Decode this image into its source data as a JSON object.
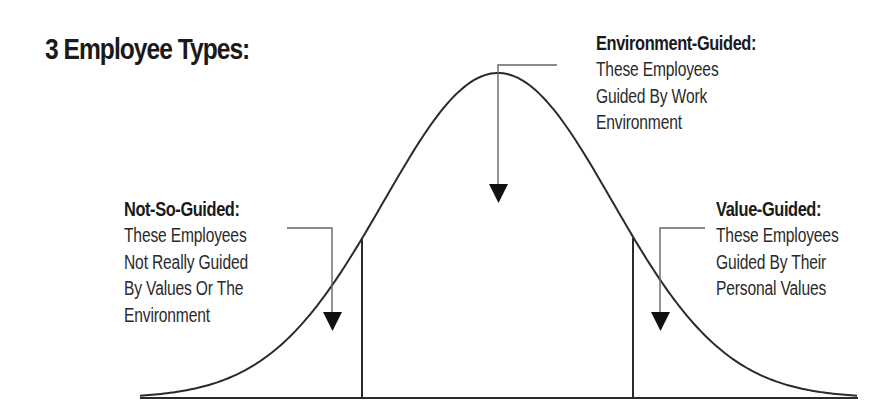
{
  "title": "3 Employee Types:",
  "groups": [
    {
      "id": "not-so-guided",
      "heading": "Not-So-Guided:",
      "lines": [
        "These Employees",
        "Not Really Guided",
        "By Values Or The",
        "Environment"
      ]
    },
    {
      "id": "environment-guided",
      "heading": "Environment-Guided:",
      "lines": [
        "These Employees",
        "Guided By Work",
        "Environment"
      ]
    },
    {
      "id": "value-guided",
      "heading": "Value-Guided:",
      "lines": [
        "These Employees",
        "Guided By Their",
        "Personal Values"
      ]
    }
  ],
  "chart_data": {
    "type": "diagram",
    "shape": "bell-curve (normal distribution)",
    "title": "3 Employee Types:",
    "regions": [
      {
        "position": "left tail",
        "label": "Not-So-Guided"
      },
      {
        "position": "center",
        "label": "Environment-Guided"
      },
      {
        "position": "right tail",
        "label": "Value-Guided"
      }
    ],
    "dividers": [
      "left of center (~-1.2σ)",
      "right of center (~+1.2σ)"
    ]
  },
  "colors": {
    "line": "#2b2b2b",
    "connector": "#555555",
    "text": "#1a1a1a"
  }
}
